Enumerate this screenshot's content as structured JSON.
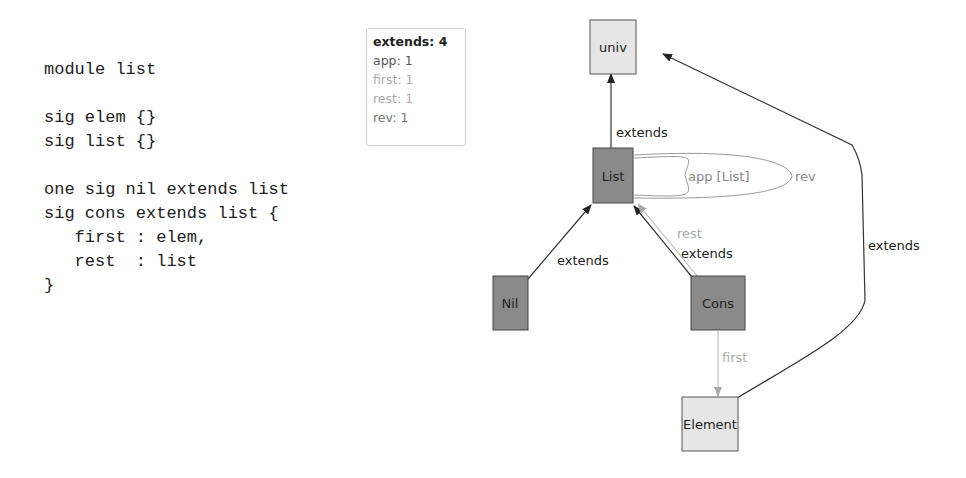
{
  "code": {
    "lines": [
      "module list",
      "",
      "sig elem {}",
      "sig list {}",
      "",
      "one sig nil extends list",
      "sig cons extends list {",
      "   first : elem,",
      "   rest  : list",
      "}"
    ]
  },
  "legend": {
    "items": [
      {
        "label": "extends: 4",
        "style": "bold"
      },
      {
        "label": "app: 1",
        "style": "dark"
      },
      {
        "label": "first: 1",
        "style": "light"
      },
      {
        "label": "rest: 1",
        "style": "light"
      },
      {
        "label": "rev: 1",
        "style": "dark"
      }
    ]
  },
  "graph": {
    "nodes": {
      "univ": {
        "label": "univ",
        "fill": "#e6e6e6"
      },
      "list": {
        "label": "List",
        "fill": "#8a8a8a"
      },
      "nil": {
        "label": "Nil",
        "fill": "#8a8a8a"
      },
      "cons": {
        "label": "Cons",
        "fill": "#8a8a8a"
      },
      "element": {
        "label": "Element",
        "fill": "#e6e6e6"
      }
    },
    "edges": {
      "list_univ": {
        "label": "extends"
      },
      "nil_list": {
        "label": "extends"
      },
      "cons_list": {
        "label": "extends"
      },
      "cons_list_rest": {
        "label": "rest"
      },
      "list_app": {
        "label": "app [List]"
      },
      "list_rev": {
        "label": "rev"
      },
      "cons_element": {
        "label": "first"
      },
      "element_univ": {
        "label": "extends"
      }
    },
    "colors": {
      "edge_dark": "#333333",
      "edge_light": "#aaaaaa",
      "node_dark": "#8a8a8a",
      "node_light": "#e6e6e6"
    }
  }
}
